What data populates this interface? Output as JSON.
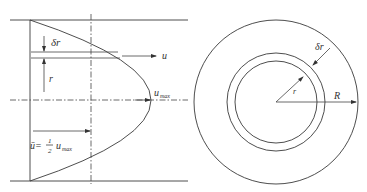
{
  "left_figure": {
    "title": "velocity-profile",
    "labels": {
      "delta_r": "δr",
      "r": "r",
      "u": "u",
      "u_max_base": "u",
      "u_max_sub": "max",
      "u_bar_lhs": "ū=",
      "half_num": "1",
      "half_den": "2",
      "u_bar_rhs_base": "u",
      "u_bar_rhs_sub": "max"
    }
  },
  "right_figure": {
    "title": "pipe-cross-section",
    "labels": {
      "delta_r": "δr",
      "r": "r",
      "R": "R"
    }
  },
  "colors": {
    "line": "#3a3a3a",
    "background": "#ffffff"
  }
}
